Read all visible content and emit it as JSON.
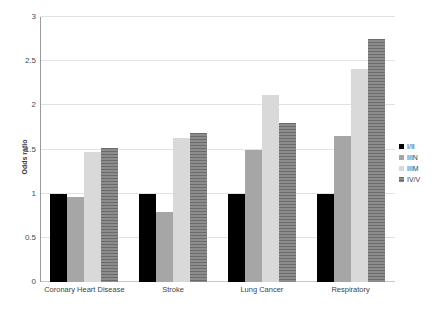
{
  "chart_data": {
    "type": "bar",
    "title": "",
    "subtitle": "",
    "xlabel": "",
    "ylabel": "Odds ratio",
    "ylim": [
      0,
      3
    ],
    "ytick_labels": [
      "0",
      "0.5",
      "1",
      "1.5",
      "2",
      "2.5",
      "3"
    ],
    "ytick_values": [
      0,
      0.5,
      1,
      1.5,
      2,
      2.5,
      3
    ],
    "grid": true,
    "legend_position": "right",
    "categories": [
      "Coronary Heart Disease",
      "Stroke",
      "Lung Cancer",
      "Respiratory"
    ],
    "series": [
      {
        "name": "I/II",
        "color": "#000000",
        "values": [
          1.0,
          1.0,
          1.0,
          1.0
        ]
      },
      {
        "name": "IIIN",
        "color": "#a6a6a6",
        "values": [
          0.96,
          0.79,
          1.49,
          1.65
        ]
      },
      {
        "name": "IIIM",
        "color": "#d9d9d9",
        "values": [
          1.47,
          1.63,
          2.12,
          2.41
        ]
      },
      {
        "name": "IV/V",
        "color": "#7f7f7f",
        "values": [
          1.52,
          1.69,
          1.8,
          2.75
        ]
      }
    ]
  },
  "axis": {
    "y_title": "Odds ratio"
  }
}
